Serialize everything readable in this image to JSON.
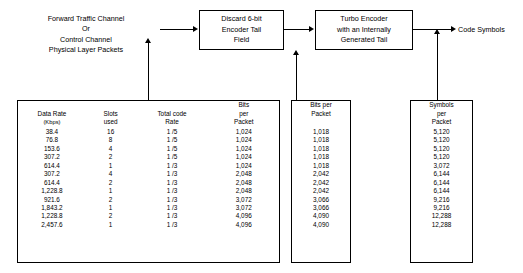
{
  "diagram": {
    "title": "",
    "nodes": {
      "source_label": "Forward Traffic Channel\nOr\nControl Channel\nPhysical Layer Packets",
      "source_line1": "Forward Traffic Channel",
      "source_line2": "Or",
      "source_line3": "Control Channel",
      "source_line4": "Physical Layer Packets",
      "discard_line1": "Discard 6-bit",
      "discard_line2": "Encoder Tail",
      "discard_line3": "Field",
      "turbo_line1": "Turbo Encoder",
      "turbo_line2": "with an Internally",
      "turbo_line3": "Generated Tail",
      "output_label": "Code Symbols"
    },
    "tables": {
      "left": {
        "headers": [
          {
            "line1": "Data Rate",
            "line2": "(Kbps)"
          },
          {
            "line1": "Slots",
            "line2": "used"
          },
          {
            "line1": "Total code",
            "line2": "Rate"
          },
          {
            "line1": "Bits",
            "line2": "per",
            "line3": "Packet"
          }
        ],
        "rows": [
          [
            "38.4",
            "16",
            "1 /5",
            "1,024"
          ],
          [
            "76.8",
            "8",
            "1 /5",
            "1,024"
          ],
          [
            "153.6",
            "4",
            "1 /5",
            "1,024"
          ],
          [
            "307.2",
            "2",
            "1 /5",
            "1,024"
          ],
          [
            "614.4",
            "1",
            "1 /3",
            "1,024"
          ],
          [
            "307.2",
            "4",
            "1 /3",
            "2,048"
          ],
          [
            "614.4",
            "2",
            "1 /3",
            "2,048"
          ],
          [
            "1,228.8",
            "1",
            "1 /3",
            "2,048"
          ],
          [
            "921.6",
            "2",
            "1 /3",
            "3,072"
          ],
          [
            "1,843.2",
            "1",
            "1 /3",
            "3,072"
          ],
          [
            "1,228.8",
            "2",
            "1 /3",
            "4,096"
          ],
          [
            "2,457.6",
            "1",
            "1 /3",
            "4,096"
          ]
        ]
      },
      "middle": {
        "headers": [
          {
            "line1": "Bits per",
            "line2": "Packet"
          }
        ],
        "rows": [
          [
            "1,018"
          ],
          [
            "1,018"
          ],
          [
            "1,018"
          ],
          [
            "1,018"
          ],
          [
            "1,018"
          ],
          [
            "2,042"
          ],
          [
            "2,042"
          ],
          [
            "2,042"
          ],
          [
            "3,066"
          ],
          [
            "3,066"
          ],
          [
            "4,090"
          ],
          [
            "4,090"
          ]
        ]
      },
      "right": {
        "headers": [
          {
            "line1": "Symbols",
            "line2": "per",
            "line3": "Packet"
          }
        ],
        "rows": [
          [
            "5,120"
          ],
          [
            "5,120"
          ],
          [
            "5,120"
          ],
          [
            "5,120"
          ],
          [
            "3,072"
          ],
          [
            "6,144"
          ],
          [
            "6,144"
          ],
          [
            "6,144"
          ],
          [
            "9,216"
          ],
          [
            "9,216"
          ],
          [
            "12,288"
          ],
          [
            "12,288"
          ]
        ]
      }
    }
  }
}
